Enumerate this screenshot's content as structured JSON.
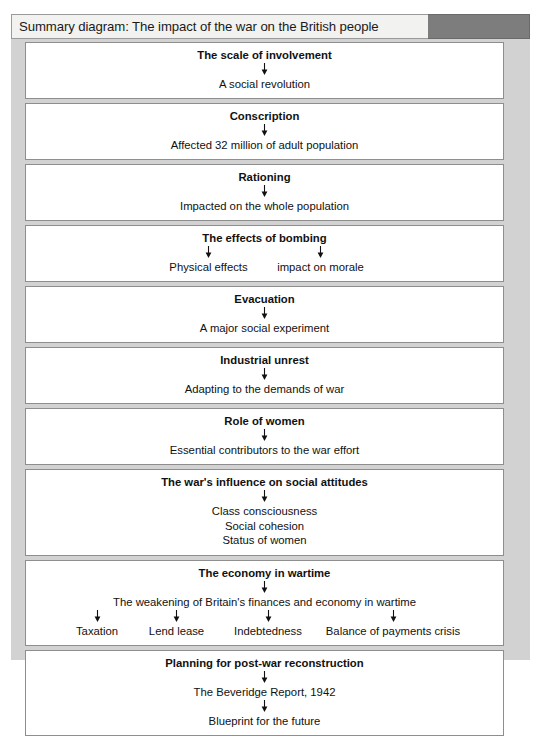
{
  "header": {
    "title": "Summary diagram: The impact of the war on the British people",
    "accent_color": "#7d7d7d",
    "plate_color": "#f2f2f0"
  },
  "panel": {
    "background_color": "#d2d2d2",
    "box_background_color": "#ffffff",
    "box_border_color": "#8e8e8e"
  },
  "icons": {
    "down_arrow": "down-arrow-icon"
  },
  "diagram": {
    "boxes": [
      {
        "id": "scale-of-involvement",
        "title": "The scale of involvement",
        "lines": [
          "A social revolution"
        ]
      },
      {
        "id": "conscription",
        "title": "Conscription",
        "lines": [
          "Affected 32 million of adult population"
        ]
      },
      {
        "id": "rationing",
        "title": "Rationing",
        "lines": [
          "Impacted on the whole population"
        ]
      },
      {
        "id": "effects-of-bombing",
        "title": "The effects of bombing",
        "branches": [
          "Physical effects",
          "impact on morale"
        ]
      },
      {
        "id": "evacuation",
        "title": "Evacuation",
        "lines": [
          "A major social experiment"
        ]
      },
      {
        "id": "industrial-unrest",
        "title": "Industrial unrest",
        "lines": [
          "Adapting to the demands of war"
        ]
      },
      {
        "id": "role-of-women",
        "title": "Role of women",
        "lines": [
          "Essential contributors to the war effort"
        ]
      },
      {
        "id": "social-attitudes",
        "title": "The war's influence on social attitudes",
        "lines": [
          "Class consciousness",
          "Social cohesion",
          "Status of women"
        ]
      },
      {
        "id": "economy-in-wartime",
        "title": "The economy in wartime",
        "subtitle": "The weakening of Britain's finances and economy in wartime",
        "branches": [
          "Taxation",
          "Lend lease",
          "Indebtedness",
          "Balance of payments crisis"
        ]
      },
      {
        "id": "post-war-reconstruction",
        "title": "Planning for post-war reconstruction",
        "lines": [
          "The Beveridge Report, 1942",
          "Blueprint for the future"
        ]
      }
    ]
  }
}
